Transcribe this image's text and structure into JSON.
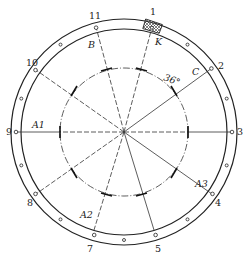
{
  "diagram": {
    "title": "",
    "center": {
      "x": 124,
      "y": 132
    },
    "rings": {
      "outer_radius": 113,
      "inner_radius": 103,
      "bolt_radius": 108,
      "dash_circle_radius": 64
    },
    "colors": {
      "line": "#222222",
      "hatch": "#333333",
      "background": "#ffffff"
    },
    "position_labels": [
      {
        "text": "1",
        "angle": 75
      },
      {
        "text": "2",
        "angle": 36
      },
      {
        "text": "3",
        "angle": 0
      },
      {
        "text": "4",
        "angle": 325
      },
      {
        "text": "5",
        "angle": 287
      },
      {
        "text": "7",
        "angle": 253
      },
      {
        "text": "8",
        "angle": 215
      },
      {
        "text": "9",
        "angle": 180
      },
      {
        "text": "10",
        "angle": 145
      },
      {
        "text": "11",
        "angle": 105
      }
    ],
    "point_labels": {
      "A1": "A1",
      "A2": "A2",
      "A3": "A3",
      "B": "B",
      "C": "C",
      "K": "K"
    },
    "angle_annotation": "36°"
  }
}
